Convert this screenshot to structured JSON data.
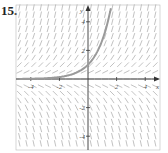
{
  "problem_number": "15.",
  "chart_data": {
    "type": "line",
    "title": "",
    "subtitle": "Slope field with solution curve",
    "xlabel": "x",
    "ylabel": "y",
    "xlim": [
      -4.8,
      5
    ],
    "ylim": [
      -5,
      5
    ],
    "x_ticks": [
      -4,
      -2,
      2,
      4
    ],
    "y_ticks": [
      -4,
      -2,
      2,
      4
    ],
    "x_tick_labels": [
      "-4",
      "-2",
      "2",
      "4"
    ],
    "y_tick_labels": [
      "-4",
      "-2",
      "2",
      "4"
    ],
    "grid": false,
    "slope_field": "dy/dx = y",
    "series": [
      {
        "name": "solution curve",
        "x": [
          -4.8,
          -4,
          -3,
          -2,
          -1,
          0,
          0.5,
          1,
          1.5,
          1.6
        ],
        "values": [
          0.008,
          0.018,
          0.05,
          0.135,
          0.37,
          1,
          1.65,
          2.72,
          4.48,
          4.95
        ]
      }
    ],
    "colors": {
      "curve": "#9a9a9a",
      "axes": "#333333",
      "field": "#a8a8a8"
    }
  }
}
